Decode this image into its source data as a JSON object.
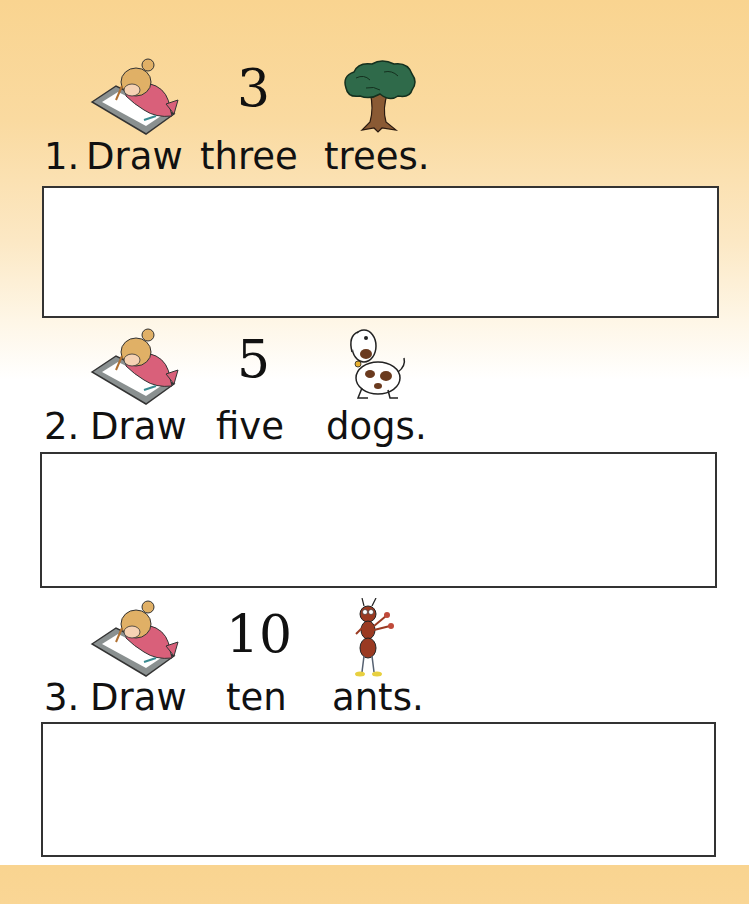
{
  "page": {
    "top_cut_text": "...",
    "background": {
      "top_color": "#f9d490",
      "bottom_color": "#ffffff"
    }
  },
  "exercises": [
    {
      "index": "1.",
      "verb": "Draw",
      "number_word": "three",
      "object": "trees.",
      "numeral": "3",
      "icons": {
        "left": "girl-drawing-icon",
        "right": "tree-icon"
      }
    },
    {
      "index": "2.",
      "verb": "Draw",
      "number_word": "five",
      "object": "dogs.",
      "numeral": "5",
      "icons": {
        "left": "girl-drawing-icon",
        "right": "dog-icon"
      }
    },
    {
      "index": "3.",
      "verb": "Draw",
      "number_word": "ten",
      "object": "ants.",
      "numeral": "10",
      "icons": {
        "left": "girl-drawing-icon",
        "right": "ant-icon"
      }
    }
  ]
}
